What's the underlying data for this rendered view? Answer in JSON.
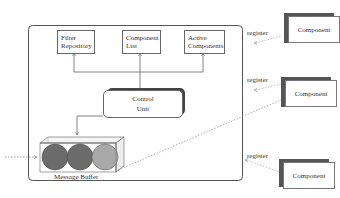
{
  "diagram": {
    "container": {
      "label": ""
    },
    "modules": [
      {
        "id": "filter-repository",
        "line1": "Filter",
        "line2": "Repository"
      },
      {
        "id": "component-list",
        "line1": "Component",
        "line2": "List"
      },
      {
        "id": "active-components",
        "line1": "Active",
        "line2": "Components"
      }
    ],
    "control_unit": {
      "line1": "Control",
      "line2": "Unit"
    },
    "message_buffer": {
      "label": "Message Buffer",
      "messages": 3
    },
    "components": [
      {
        "label": "Component",
        "register_label": "register"
      },
      {
        "label": "Component",
        "register_label": "register"
      },
      {
        "label": "Component",
        "register_label": "register"
      }
    ],
    "colors": {
      "line": "#666666",
      "shadow": "#555555",
      "ball_dark": "#6b6b6b",
      "ball_light": "#a8a8a8"
    }
  }
}
